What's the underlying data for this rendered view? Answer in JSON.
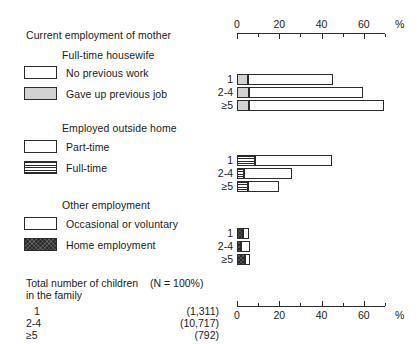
{
  "figure": {
    "axis_unit": "%",
    "scale_min": 0,
    "scale_max": 70,
    "ticks_major": [
      "0",
      "20",
      "40",
      "60"
    ],
    "tick_major_values": [
      0,
      20,
      40,
      60
    ],
    "tick_minor_values": [
      10,
      30,
      50,
      70
    ]
  },
  "headings": {
    "main_title": "Current employment of mother",
    "group1_title": "Full-time housewife",
    "group2_title": "Employed outside home",
    "group3_title": "Other employment"
  },
  "legend": {
    "group1": [
      {
        "label": "No previous work",
        "swatch": "white"
      },
      {
        "label": "Gave up previous job",
        "swatch": "grey"
      }
    ],
    "group2": [
      {
        "label": "Part-time",
        "swatch": "white"
      },
      {
        "label": "Full-time",
        "swatch": "hatch"
      }
    ],
    "group3": [
      {
        "label": "Occasional or voluntary",
        "swatch": "white"
      },
      {
        "label": "Home employment",
        "swatch": "dark"
      }
    ]
  },
  "row_labels": [
    "1",
    "2-4",
    "≥5"
  ],
  "table": {
    "title_line1": "Total number of children",
    "title_line2": "in the family",
    "n_note": "(N = 100%)",
    "rows": [
      {
        "category": "1",
        "value": "(1,311)"
      },
      {
        "category": "2-4",
        "value": "(10,717)"
      },
      {
        "category": "≥5",
        "value": "(792)"
      }
    ]
  },
  "chart_data": {
    "type": "bar",
    "orientation": "horizontal-stacked",
    "title": "Current employment of mother",
    "xlabel": "%",
    "ylabel": "Total number of children in the family",
    "xlim": [
      0,
      70
    ],
    "grid": false,
    "legend_position": "left",
    "categories": [
      "1",
      "2-4",
      "≥5"
    ],
    "panels": [
      {
        "name": "Full-time housewife",
        "series": [
          {
            "name": "Gave up previous job",
            "fill": "grey",
            "values": [
              5.0,
              5.5,
              5.5
            ]
          },
          {
            "name": "No previous work",
            "fill": "white",
            "values": [
              40.5,
              54.0,
              64.0
            ]
          }
        ],
        "totals": [
          45.5,
          59.5,
          69.5
        ]
      },
      {
        "name": "Employed outside home",
        "series": [
          {
            "name": "Full-time",
            "fill": "hatch",
            "values": [
              8.5,
              3.5,
              5.0
            ]
          },
          {
            "name": "Part-time",
            "fill": "white",
            "values": [
              36.5,
              22.5,
              15.0
            ]
          }
        ],
        "totals": [
          45.0,
          26.0,
          20.0
        ]
      },
      {
        "name": "Other employment",
        "series": [
          {
            "name": "Home employment",
            "fill": "dark",
            "values": [
              2.8,
              2.0,
              3.8
            ]
          },
          {
            "name": "Occasional or voluntary",
            "fill": "white",
            "values": [
              3.0,
              4.0,
              2.3
            ]
          }
        ],
        "totals": [
          5.8,
          6.0,
          6.1
        ]
      }
    ],
    "table_counts": [
      {
        "category": "1",
        "n": 1311
      },
      {
        "category": "2-4",
        "n": 10717
      },
      {
        "category": "≥5",
        "n": 792
      }
    ]
  },
  "colors": {
    "ink": "#2b2b2b",
    "grey_fill": "#d2d2d2",
    "dark_fill": "#2a2a2a",
    "background": "#ffffff"
  }
}
